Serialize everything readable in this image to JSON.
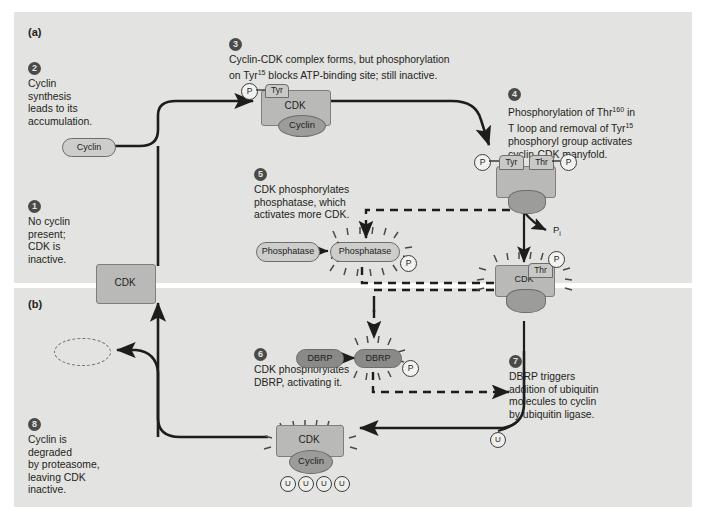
{
  "figure": {
    "panel_a_label": "(a)",
    "panel_b_label": "(b)",
    "background_color": "#e3e3e1",
    "page_color": "#ffffff",
    "protein_fill": "#b9b9b7",
    "cyclin_fill": "#9c9c9a",
    "dark_pill_fill": "#8a8a88"
  },
  "steps": [
    {
      "num": "1",
      "text": "No cyclin\npresent;\nCDK is\ninactive."
    },
    {
      "num": "2",
      "text": "Cyclin\nsynthesis\nleads to its\naccumulation."
    },
    {
      "num": "3",
      "text": "Cyclin-CDK complex forms, but phosphorylation\non Tyr15 blocks ATP-binding site; still inactive.",
      "line1": "Cyclin-CDK complex forms, but phosphorylation",
      "line2a": "on Tyr",
      "line2sup": "15",
      "line2b": " blocks ATP-binding site; still inactive."
    },
    {
      "num": "4",
      "text": "Phosphorylation of Thr160 in\nT loop and removal of Tyr15\nphosphoryl group activates\ncyclin-CDK manyfold.",
      "line1a": "Phosphorylation of Thr",
      "line1sup": "160",
      "line1b": " in",
      "line2a": "T loop and removal of Tyr",
      "line2sup": "15",
      "line3": "phosphoryl group activates",
      "line4": "cyclin-CDK manyfold."
    },
    {
      "num": "5",
      "text": "CDK phosphorylates\nphosphatase, which\nactivates more CDK."
    },
    {
      "num": "6",
      "text": "CDK phosphorylates\nDBRP, activating it."
    },
    {
      "num": "7",
      "text": "DBRP triggers\naddition of ubiquitin\nmolecules to cyclin\nby ubiquitin ligase."
    },
    {
      "num": "8",
      "text": "Cyclin is\ndegraded\nby proteasome,\nleaving CDK\ninactive."
    }
  ],
  "molecules": {
    "cdk": "CDK",
    "cyclin": "Cyclin",
    "phosphatase": "Phosphatase",
    "dbrp": "DBRP",
    "tyr": "Tyr",
    "thr": "Thr",
    "phosphate": "P",
    "ubiquitin": "U",
    "pi_label": "P",
    "pi_subscript": "i"
  },
  "ubiquitin_chain": [
    "U",
    "U",
    "U",
    "U"
  ]
}
